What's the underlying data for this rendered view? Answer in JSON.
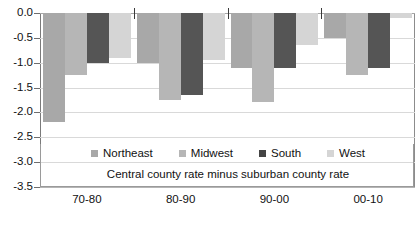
{
  "chart_data": {
    "type": "bar",
    "title": "",
    "subtitle": "",
    "xlabel": "",
    "ylabel": "",
    "caption": "Central county rate minus suburban county rate",
    "categories": [
      "70-80",
      "80-90",
      "90-00",
      "00-10"
    ],
    "ylim": [
      -3.5,
      0.0
    ],
    "yticks": [
      "0.0",
      "-0.5",
      "-1.0",
      "-1.5",
      "-2.0",
      "-2.5",
      "-3.0",
      "-3.5"
    ],
    "ytick_values": [
      0.0,
      -0.5,
      -1.0,
      -1.5,
      -2.0,
      -2.5,
      -3.0,
      -3.5
    ],
    "grid": true,
    "legend_position": "bottom",
    "series": [
      {
        "name": "Northeast",
        "color": "#a8a8a8",
        "values": [
          -2.2,
          -1.0,
          -1.1,
          -0.5
        ]
      },
      {
        "name": "Midwest",
        "color": "#b6b6b6",
        "values": [
          -1.25,
          -1.75,
          -1.8,
          -1.25
        ]
      },
      {
        "name": "South",
        "color": "#555555",
        "values": [
          -1.0,
          -1.65,
          -1.1,
          -1.1
        ]
      },
      {
        "name": "West",
        "color": "#d5d5d5",
        "values": [
          -0.9,
          -0.95,
          -0.65,
          -0.1
        ]
      }
    ]
  },
  "legend": {
    "items": [
      {
        "label": "Northeast",
        "key": "northeast"
      },
      {
        "label": "Midwest",
        "key": "midwest"
      },
      {
        "label": "South",
        "key": "south"
      },
      {
        "label": "West",
        "key": "west"
      }
    ]
  }
}
